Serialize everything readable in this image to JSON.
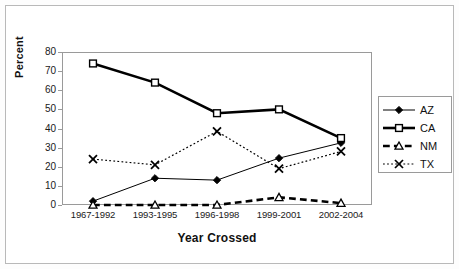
{
  "chart_data": {
    "type": "line",
    "title": "",
    "xlabel": "Year Crossed",
    "ylabel": "Percent",
    "categories": [
      "1967-1992",
      "1993-1995",
      "1996-1998",
      "1999-2001",
      "2002-2004"
    ],
    "ylim": [
      0,
      80
    ],
    "yticks": [
      0,
      10,
      20,
      30,
      40,
      50,
      60,
      70,
      80
    ],
    "grid": false,
    "legend_position": "right",
    "series": [
      {
        "name": "AZ",
        "values": [
          2,
          14,
          13,
          24.5,
          32.5
        ],
        "marker": "filled-diamond",
        "line_style": "solid",
        "line_width": 1,
        "color": "#000000"
      },
      {
        "name": "CA",
        "values": [
          74,
          64,
          48,
          50,
          35
        ],
        "marker": "open-square",
        "line_style": "solid",
        "line_width": 2.6,
        "color": "#000000"
      },
      {
        "name": "NM",
        "values": [
          0,
          0,
          0,
          4,
          1
        ],
        "marker": "open-triangle",
        "line_style": "dashed",
        "line_width": 2.6,
        "color": "#000000"
      },
      {
        "name": "TX",
        "values": [
          24,
          21,
          38.5,
          19,
          28
        ],
        "marker": "x-cross",
        "line_style": "dotted",
        "line_width": 1.2,
        "color": "#000000"
      }
    ]
  },
  "axes": {
    "y_title": "Percent",
    "x_title": "Year Crossed",
    "y_tick_labels": [
      "80",
      "70",
      "60",
      "50",
      "40",
      "30",
      "20",
      "10",
      "0"
    ],
    "x_tick_labels": [
      "1967-1992",
      "1993-1995",
      "1996-1998",
      "1999-2001",
      "2002-2004"
    ]
  },
  "legend": {
    "entries": [
      {
        "label": "AZ",
        "icon": "filled-diamond-marker-icon"
      },
      {
        "label": "CA",
        "icon": "open-square-marker-icon"
      },
      {
        "label": "NM",
        "icon": "open-triangle-marker-icon"
      },
      {
        "label": "TX",
        "icon": "x-cross-marker-icon"
      }
    ]
  },
  "colors": {
    "line": "#000000",
    "plot_border": "#9a9a9a",
    "figure_border": "#b9b9b9",
    "background": "#ffffff",
    "text": "#111111"
  }
}
